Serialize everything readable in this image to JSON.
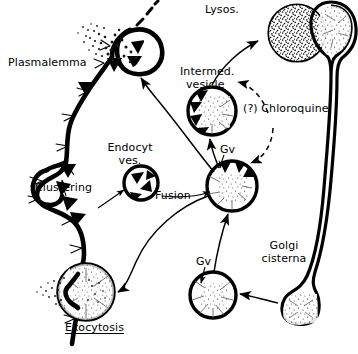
{
  "figure": {
    "domain": "Diagram",
    "background_color": "#ffffff",
    "ink_color": "#000000",
    "width": 358,
    "height": 354
  },
  "labels": {
    "plasmalemma": "Plasmalemma",
    "clustering": "Clustering",
    "endocyt_ves_line1": "Endocyt",
    "endocyt_ves_line2": "ves.",
    "fusion": "Fusion",
    "exocytosis": "Exocytosis",
    "lysos": "Lysos.",
    "intermed_line1": "Intermed.",
    "intermed_line2": "vesicle",
    "chloroquine": "(?) Chloroquine",
    "gv_upper": "Gv",
    "gv_lower": "Gv",
    "golgi_line1": "Golgi",
    "golgi_line2": "cisterna"
  },
  "structures": [
    {
      "name": "plasmalemma-membrane",
      "kind": "undulating-membrane",
      "description": "Thick wavy plasma membrane running from upper-right down the left side to lower-left, bearing dark triangular receptor clusters and fine hair-like projections on its outer face"
    },
    {
      "name": "endocytotic-pit",
      "kind": "coated-pit-vesicle",
      "description": "Round invagination at top of membrane with dark triangles inside and a stippled spray of particles escaping upward"
    },
    {
      "name": "clustering-pit",
      "kind": "membrane-bulge",
      "description": "Outward bulge of the membrane where receptor triangles gather"
    },
    {
      "name": "endocytotic-vesicle",
      "kind": "vesicle-with-receptors",
      "description": "Small free circular vesicle containing four inward-pointing dark triangles"
    },
    {
      "name": "exocytotic-vesicle",
      "kind": "fusing-vesicle",
      "description": "Large circle fused with membrane at lower left, discharging stippled content outward"
    },
    {
      "name": "lysosome",
      "kind": "dense-stippled-circle",
      "description": "Large circle densely filled with stipple at top right"
    },
    {
      "name": "intermediate-vesicle",
      "kind": "vesicle-with-receptors-and-content",
      "description": "Circle with dark triangles along its left inner rim and stippled content in the centre"
    },
    {
      "name": "golgi-vesicle-upper",
      "kind": "vesicle-with-receptors-and-content",
      "description": "Central circle with dark triangles along the top rim and stippled content"
    },
    {
      "name": "golgi-vesicle-lower",
      "kind": "vesicle-with-content",
      "description": "Circle containing stippled content, budded from the Golgi cisterna"
    },
    {
      "name": "golgi-cisterna",
      "kind": "elongated-cisterna",
      "description": "Long narrow curved tube at the right with dilated stippled ends at top and bottom"
    }
  ],
  "arrows": [
    {
      "name": "endocytotic-vesicle-to-pit",
      "style": "solid",
      "from": "golgi-vesicle-upper",
      "to": "endocytotic-pit"
    },
    {
      "name": "fusion-to-intermediate-vesicle",
      "style": "solid",
      "from": "golgi-vesicle-upper",
      "to": "intermediate-vesicle"
    },
    {
      "name": "intermediate-vesicle-to-lysosome",
      "style": "solid",
      "from": "intermediate-vesicle",
      "to": "lysosome"
    },
    {
      "name": "lower-gv-to-upper-gv",
      "style": "solid",
      "from": "golgi-vesicle-lower",
      "to": "golgi-vesicle-upper"
    },
    {
      "name": "golgi-cisterna-to-lower-gv",
      "style": "solid",
      "from": "golgi-cisterna",
      "to": "golgi-vesicle-lower"
    },
    {
      "name": "upper-gv-to-exocytotic-vesicle",
      "style": "solid",
      "from": "golgi-vesicle-upper",
      "to": "exocytotic-vesicle"
    },
    {
      "name": "chloroquine-block-intermediate",
      "style": "dashed",
      "from": "chloroquine-label",
      "to": "intermediate-vesicle"
    },
    {
      "name": "chloroquine-block-gv",
      "style": "dashed",
      "from": "chloroquine-label",
      "to": "golgi-vesicle-upper"
    },
    {
      "name": "clustering-pointer",
      "style": "solid-thin",
      "from": "clustering-label",
      "to": "clustering-pit"
    },
    {
      "name": "endocyt-ves-pointer",
      "style": "solid-thin",
      "from": "clustering-region",
      "to": "endocytotic-vesicle"
    },
    {
      "name": "gv-upper-pointer",
      "style": "solid-thin",
      "from": "gv-upper-label",
      "to": "golgi-vesicle-upper"
    },
    {
      "name": "gv-lower-pointer",
      "style": "solid-thin",
      "from": "gv-lower-label",
      "to": "golgi-vesicle-lower"
    }
  ]
}
